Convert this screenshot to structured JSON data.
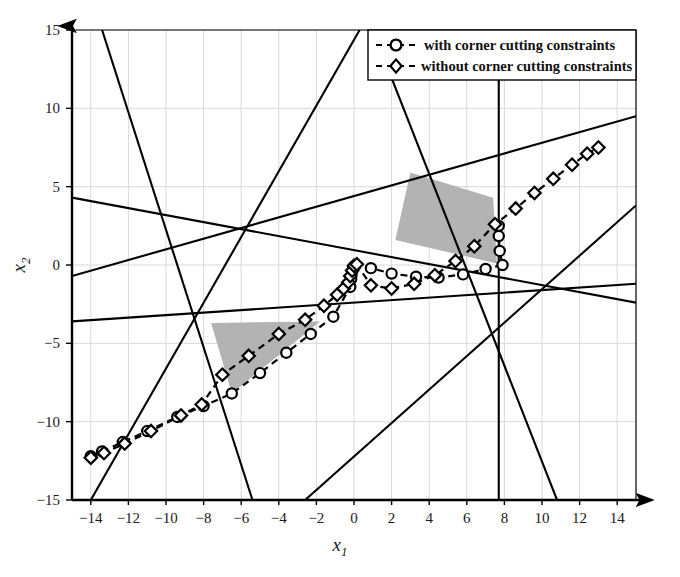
{
  "figure": {
    "background_color": "#ffffff",
    "line_color": "#000000",
    "shade_color": "#b3b3b3",
    "grid_color": "#d8d8d8"
  },
  "legend": {
    "position": "top-right",
    "border_color": "#000000",
    "items": [
      {
        "label": "with corner cutting constraints",
        "marker": "circle",
        "dash": "dashed"
      },
      {
        "label": "without corner cutting constraints",
        "marker": "diamond",
        "dash": "dashed"
      }
    ]
  },
  "chart_data": {
    "type": "line",
    "title": "",
    "xlabel": "x_1",
    "ylabel": "x_2",
    "xlabel_display": "x",
    "xlabel_sub": "1",
    "ylabel_display": "x",
    "ylabel_sub": "2",
    "xlim": [
      -15,
      15
    ],
    "ylim": [
      -15,
      15
    ],
    "xticks": [
      -14,
      -12,
      -10,
      -8,
      -6,
      -4,
      -2,
      0,
      2,
      4,
      6,
      8,
      10,
      12,
      14
    ],
    "yticks": [
      -15,
      -10,
      -5,
      0,
      5,
      10,
      15
    ],
    "xtick_labels": [
      "-14",
      "-12",
      "-10",
      "-8",
      "-6",
      "-4",
      "-2",
      "0",
      "2",
      "4",
      "6",
      "8",
      "10",
      "12",
      "14"
    ],
    "ytick_labels": [
      "-15",
      "-10",
      "-5",
      "0",
      "5",
      "10",
      "15"
    ],
    "grid": true,
    "legend_position": "upper right",
    "series": [
      {
        "name": "with corner cutting constraints",
        "marker": "circle",
        "dash": "dashed",
        "points": [
          [
            -14.0,
            -12.2
          ],
          [
            -13.4,
            -11.9
          ],
          [
            -12.3,
            -11.3
          ],
          [
            -11.0,
            -10.6
          ],
          [
            -9.4,
            -9.7
          ],
          [
            -8.0,
            -9.0
          ],
          [
            -6.5,
            -8.2
          ],
          [
            -5.0,
            -6.9
          ],
          [
            -3.6,
            -5.6
          ],
          [
            -2.3,
            -4.4
          ],
          [
            -1.1,
            -3.3
          ],
          [
            -0.2,
            -1.4
          ],
          [
            -0.15,
            -0.9
          ],
          [
            -0.1,
            -0.45
          ],
          [
            -0.05,
            -0.2
          ],
          [
            0.0,
            -0.1
          ],
          [
            0.9,
            -0.2
          ],
          [
            2.0,
            -0.55
          ],
          [
            3.3,
            -0.75
          ],
          [
            4.5,
            -0.8
          ],
          [
            5.8,
            -0.6
          ],
          [
            7.0,
            -0.25
          ],
          [
            7.9,
            0.0
          ],
          [
            7.75,
            0.9
          ],
          [
            7.7,
            1.85
          ],
          [
            7.7,
            2.5
          ]
        ]
      },
      {
        "name": "without corner cutting constraints",
        "marker": "diamond",
        "dash": "dashed",
        "points": [
          [
            -14.0,
            -12.3
          ],
          [
            -13.3,
            -12.0
          ],
          [
            -12.2,
            -11.4
          ],
          [
            -10.8,
            -10.6
          ],
          [
            -9.2,
            -9.6
          ],
          [
            -8.1,
            -8.9
          ],
          [
            -7.0,
            -7.0
          ],
          [
            -5.6,
            -5.8
          ],
          [
            -4.0,
            -4.4
          ],
          [
            -2.6,
            -3.5
          ],
          [
            -1.6,
            -2.6
          ],
          [
            -0.9,
            -1.9
          ],
          [
            -0.55,
            -1.5
          ],
          [
            -0.3,
            -1.1
          ],
          [
            -0.2,
            -0.7
          ],
          [
            -0.1,
            -0.35
          ],
          [
            0.0,
            -0.05
          ],
          [
            0.15,
            0.05
          ],
          [
            0.9,
            -1.3
          ],
          [
            2.0,
            -1.5
          ],
          [
            3.2,
            -1.2
          ],
          [
            4.3,
            -0.65
          ],
          [
            5.4,
            0.25
          ],
          [
            6.4,
            1.2
          ],
          [
            7.5,
            2.6
          ],
          [
            8.6,
            3.6
          ],
          [
            9.6,
            4.6
          ],
          [
            10.6,
            5.5
          ],
          [
            11.6,
            6.4
          ],
          [
            12.4,
            7.1
          ],
          [
            13.0,
            7.5
          ]
        ]
      }
    ],
    "constraint_lines": [
      {
        "id": "line-1",
        "from": [
          -15.0,
          4.3
        ],
        "to": [
          15.0,
          -2.4
        ]
      },
      {
        "id": "line-2",
        "from": [
          -15.0,
          -0.7
        ],
        "to": [
          15.0,
          9.5
        ]
      },
      {
        "id": "line-3",
        "from": [
          -15.0,
          -3.6
        ],
        "to": [
          15.0,
          -1.2
        ]
      },
      {
        "id": "line-4",
        "from": [
          -13.4,
          15.0
        ],
        "to": [
          -5.4,
          -15.0
        ]
      },
      {
        "id": "line-5",
        "from": [
          0.3,
          15.0
        ],
        "to": [
          -14.0,
          -15.0
        ]
      },
      {
        "id": "line-6",
        "from": [
          1.0,
          15.0
        ],
        "to": [
          10.8,
          -15.0
        ]
      },
      {
        "id": "line-7",
        "from": [
          7.7,
          15.0
        ],
        "to": [
          7.7,
          -15.0
        ]
      },
      {
        "id": "line-8",
        "from": [
          15.0,
          3.8
        ],
        "to": [
          -2.6,
          -15.0
        ]
      }
    ],
    "shaded_regions": [
      {
        "id": "upper-feasible-region",
        "shape": "quadrilateral",
        "vertices": [
          [
            3.0,
            5.9
          ],
          [
            7.4,
            4.3
          ],
          [
            7.6,
            0.1
          ],
          [
            2.2,
            1.6
          ]
        ]
      },
      {
        "id": "lower-feasible-region",
        "shape": "triangle",
        "vertices": [
          [
            -7.6,
            -3.7
          ],
          [
            -1.8,
            -3.6
          ],
          [
            -6.5,
            -8.2
          ]
        ]
      }
    ]
  }
}
